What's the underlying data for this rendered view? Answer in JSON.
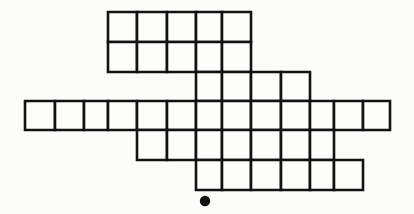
{
  "figure": {
    "background_color": "#fcfcfa",
    "cell_fill_color": "#fdfdfb",
    "line_color": "#121212",
    "dot_color": "#111111",
    "line_width": "2.6",
    "canvas": {
      "width": 414,
      "height": 214
    },
    "geometry": {
      "column_edges": [
        25,
        55,
        84,
        108,
        137,
        167,
        196,
        222,
        251,
        281,
        310,
        334,
        363,
        390
      ],
      "row_edges": [
        12,
        42,
        72,
        101,
        130,
        160,
        190
      ],
      "cell_width_nominal": 29.5,
      "cell_height_nominal": 29.6,
      "center_column_left": 196,
      "center_column_right": 222
    },
    "rows": [
      {
        "index": 1,
        "top": 12,
        "bottom": 42,
        "cell_count": 5,
        "cells": [
          {
            "x": 108,
            "w": 29
          },
          {
            "x": 137,
            "w": 30
          },
          {
            "x": 167,
            "w": 29
          },
          {
            "x": 196,
            "w": 26
          },
          {
            "x": 222,
            "w": 29
          }
        ]
      },
      {
        "index": 2,
        "top": 42,
        "bottom": 72,
        "cell_count": 5,
        "cells": [
          {
            "x": 108,
            "w": 29
          },
          {
            "x": 137,
            "w": 30
          },
          {
            "x": 167,
            "w": 29
          },
          {
            "x": 196,
            "w": 26
          },
          {
            "x": 222,
            "w": 29
          }
        ]
      },
      {
        "index": 3,
        "top": 72,
        "bottom": 101,
        "cell_count": 4,
        "cells": [
          {
            "x": 196,
            "w": 26
          },
          {
            "x": 222,
            "w": 29
          },
          {
            "x": 251,
            "w": 30
          },
          {
            "x": 281,
            "w": 29
          }
        ]
      },
      {
        "index": 4,
        "top": 101,
        "bottom": 130,
        "cell_count": 13,
        "cells": [
          {
            "x": 25,
            "w": 30
          },
          {
            "x": 55,
            "w": 29
          },
          {
            "x": 84,
            "w": 24
          },
          {
            "x": 108,
            "w": 29
          },
          {
            "x": 137,
            "w": 30
          },
          {
            "x": 167,
            "w": 29
          },
          {
            "x": 196,
            "w": 26
          },
          {
            "x": 222,
            "w": 29
          },
          {
            "x": 251,
            "w": 30
          },
          {
            "x": 281,
            "w": 29
          },
          {
            "x": 310,
            "w": 24
          },
          {
            "x": 334,
            "w": 29
          },
          {
            "x": 363,
            "w": 27
          }
        ]
      },
      {
        "index": 5,
        "top": 130,
        "bottom": 160,
        "cell_count": 7,
        "cells": [
          {
            "x": 137,
            "w": 30
          },
          {
            "x": 167,
            "w": 29
          },
          {
            "x": 196,
            "w": 26
          },
          {
            "x": 222,
            "w": 29
          },
          {
            "x": 251,
            "w": 30
          },
          {
            "x": 281,
            "w": 29
          },
          {
            "x": 310,
            "w": 24
          }
        ]
      },
      {
        "index": 6,
        "top": 160,
        "bottom": 190,
        "cell_count": 6,
        "cells": [
          {
            "x": 196,
            "w": 26
          },
          {
            "x": 222,
            "w": 29
          },
          {
            "x": 251,
            "w": 30
          },
          {
            "x": 281,
            "w": 29
          },
          {
            "x": 310,
            "w": 24
          },
          {
            "x": 334,
            "w": 29
          }
        ]
      }
    ],
    "dot": {
      "label": "reference-dot",
      "cx": 205,
      "cy": 201,
      "r": 5.2
    },
    "faint_marks": [
      {
        "text": "",
        "x": 258,
        "y": 22
      },
      {
        "text": "",
        "x": 258,
        "y": 40
      }
    ]
  }
}
